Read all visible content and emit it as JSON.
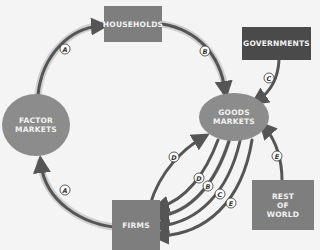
{
  "diagram": {
    "type": "circular-flow",
    "nodes": {
      "households": "HOUSEHOLDS",
      "governments": "GOVERNMENTS",
      "goods_markets": "GOODS\nMARKETS",
      "factor_markets": "FACTOR\nMARKETS",
      "firms": "FIRMS",
      "rest_of_world": "REST\nOF\nWORLD"
    },
    "flows": [
      {
        "label": "A",
        "from": "factor_markets",
        "to": "households"
      },
      {
        "label": "B",
        "from": "households",
        "to": "goods_markets"
      },
      {
        "label": "C",
        "from": "governments",
        "to": "goods_markets"
      },
      {
        "label": "A",
        "from": "firms",
        "to": "factor_markets"
      },
      {
        "label": "D",
        "from": "firms",
        "to": "goods_markets"
      },
      {
        "label": "D",
        "from": "goods_markets",
        "to": "firms"
      },
      {
        "label": "B",
        "from": "goods_markets",
        "to": "firms"
      },
      {
        "label": "C",
        "from": "goods_markets",
        "to": "firms"
      },
      {
        "label": "E",
        "from": "goods_markets",
        "to": "firms"
      },
      {
        "label": "E",
        "from": "rest_of_world",
        "to": "goods_markets"
      }
    ],
    "colors": {
      "box": "#7e7e7e",
      "box_dark": "#4a4a4a",
      "ellipse": "#8c8c8c",
      "arrow": "#555555",
      "arrow_halo": "#c8c8c8"
    }
  }
}
